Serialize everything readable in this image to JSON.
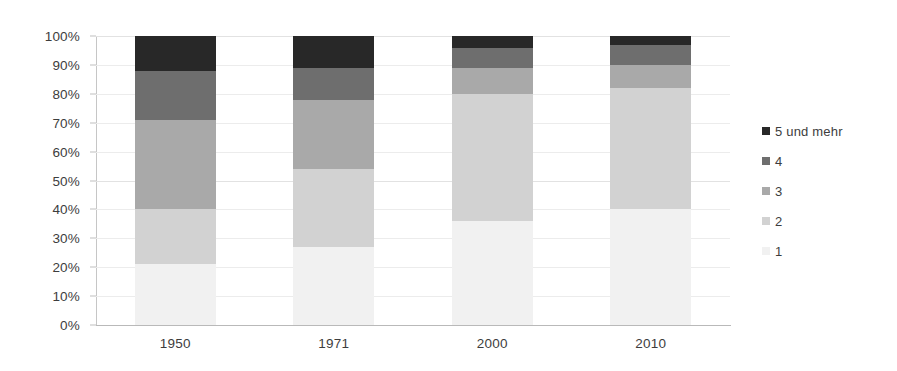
{
  "chart_data": {
    "type": "bar",
    "subtype": "stacked-100",
    "title": "",
    "xlabel": "",
    "ylabel": "",
    "categories": [
      "1950",
      "1971",
      "2000",
      "2010"
    ],
    "ylim": [
      0,
      100
    ],
    "y_tick_labels": [
      "0%",
      "10%",
      "20%",
      "30%",
      "40%",
      "50%",
      "60%",
      "70%",
      "80%",
      "90%",
      "100%"
    ],
    "y_tick_values": [
      0,
      10,
      20,
      30,
      40,
      50,
      60,
      70,
      80,
      90,
      100
    ],
    "grid": true,
    "legend_position": "right",
    "series": [
      {
        "name": "1",
        "color": "#f1f1f1",
        "values": [
          21,
          27,
          36,
          40
        ]
      },
      {
        "name": "2",
        "color": "#d2d2d2",
        "values": [
          19,
          27,
          44,
          42
        ]
      },
      {
        "name": "3",
        "color": "#a9a9a9",
        "values": [
          31,
          24,
          9,
          8
        ]
      },
      {
        "name": "4",
        "color": "#6e6e6e",
        "values": [
          17,
          11,
          7,
          7
        ]
      },
      {
        "name": "5 und mehr",
        "color": "#282828",
        "values": [
          12,
          11,
          4,
          3
        ]
      }
    ],
    "legend_order_top_to_bottom": [
      "5 und mehr",
      "4",
      "3",
      "2",
      "1"
    ],
    "cumulative_tops": {
      "1950": [
        21,
        40,
        71,
        88,
        100
      ],
      "1971": [
        27,
        54,
        78,
        89,
        100
      ],
      "2000": [
        36,
        80,
        89,
        96,
        100
      ],
      "2010": [
        40,
        82,
        90,
        97,
        100
      ]
    }
  },
  "legend": {
    "items": [
      {
        "label": "5 und mehr",
        "color": "#282828"
      },
      {
        "label": "4",
        "color": "#6e6e6e"
      },
      {
        "label": "3",
        "color": "#a9a9a9"
      },
      {
        "label": "2",
        "color": "#d2d2d2"
      },
      {
        "label": "1",
        "color": "#f1f1f1"
      }
    ]
  }
}
